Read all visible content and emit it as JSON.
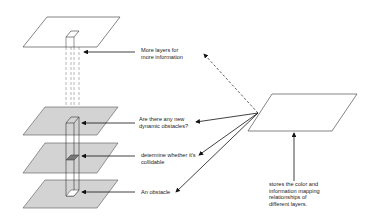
{
  "diagram": {
    "labels": {
      "more_layers": "More layers for\nmore information",
      "dynamic_obstacles": "Are there any new\ndynamic obstacles?",
      "collidable": "determine whether it's\ncollidable",
      "obstacle": "An obstacle",
      "mapping": "stores the color and\ninformation mapping\nrelationships of\ndifferent layers."
    },
    "colors": {
      "gray_plane": "#d3d3d3",
      "white_plane": "#ffffff",
      "stroke": "#333333",
      "obstacle_fill": "#777777"
    }
  }
}
